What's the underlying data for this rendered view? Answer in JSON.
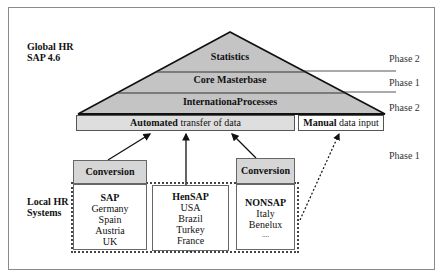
{
  "labels": {
    "global": [
      "Global HR",
      "SAP 4.6"
    ],
    "local": [
      "Local HR",
      "Systems"
    ]
  },
  "pyramid": {
    "layers": [
      {
        "label": "Statistics",
        "phase": "Phase 2"
      },
      {
        "label": "Core Masterbase",
        "phase": "Phase 1"
      },
      {
        "label": "InternationaProcesses",
        "phase": "Phase 2"
      }
    ],
    "fill_color": "#c4c4c4"
  },
  "transfer": {
    "automated_bold": "Automated",
    "automated_rest": " transfer of data",
    "manual_bold": "Manual",
    "manual_rest": " data input"
  },
  "lower_phase": "Phase 1",
  "conversion_label": "Conversion",
  "systems": [
    {
      "title": "SAP",
      "items": [
        "Germany",
        "Spain",
        "Austria",
        "UK"
      ]
    },
    {
      "title": "HenSAP",
      "items": [
        "USA",
        "Brazil",
        "Turkey",
        "France",
        "...."
      ]
    },
    {
      "title": "NONSAP",
      "items": [
        "Italy",
        "Benelux",
        "...."
      ]
    }
  ]
}
